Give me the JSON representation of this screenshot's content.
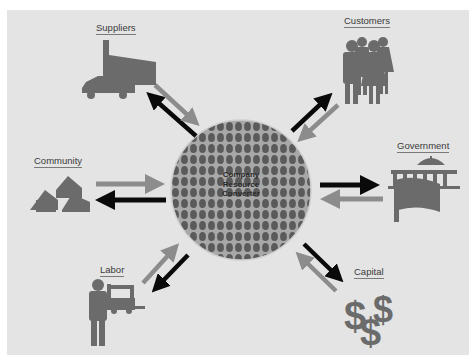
{
  "diagram": {
    "center": {
      "lines": [
        "Company",
        "Resource",
        "Converter"
      ]
    },
    "nodes": [
      {
        "id": "suppliers",
        "label": "Suppliers",
        "icon": "factory-truck-icon"
      },
      {
        "id": "customers",
        "label": "Customers",
        "icon": "people-group-icon"
      },
      {
        "id": "government",
        "label": "Government",
        "icon": "capitol-flag-icon"
      },
      {
        "id": "community",
        "label": "Community",
        "icon": "houses-icon"
      },
      {
        "id": "labor",
        "label": "Labor",
        "icon": "worker-forklift-icon"
      },
      {
        "id": "capital",
        "label": "Capital",
        "icon": "dollar-signs-icon"
      }
    ],
    "arrow_legend": {
      "black": "outflow from company",
      "gray": "inflow to company"
    },
    "colors": {
      "background": "#e4e4e4",
      "icon": "#6b6b6b",
      "arrow_out": "#0a0a0a",
      "arrow_in": "#8c8c8c",
      "circle_dots": "#555555",
      "circle_bg": "#9a9a9a"
    }
  }
}
